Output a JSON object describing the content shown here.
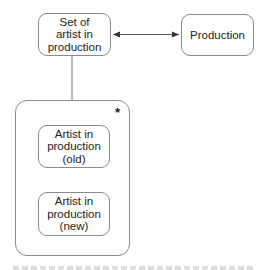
{
  "diagram": {
    "nodes": {
      "set_of_artist": {
        "label": "Set of\nartist in\nproduction"
      },
      "production": {
        "label": "Production"
      },
      "artist_old": {
        "label": "Artist in\nproduction\n(old)"
      },
      "artist_new": {
        "label": "Artist in\nproduction\n(new)"
      }
    },
    "container": {
      "multiplicity": "*"
    },
    "edges": [
      {
        "from": "set_of_artist",
        "to": "production",
        "type": "bidirectional-arrow"
      },
      {
        "from": "set_of_artist",
        "to": "container",
        "type": "line"
      }
    ],
    "colors": {
      "stroke": "#8a8a8a",
      "text": "#222222",
      "arrow": "#333333"
    }
  }
}
